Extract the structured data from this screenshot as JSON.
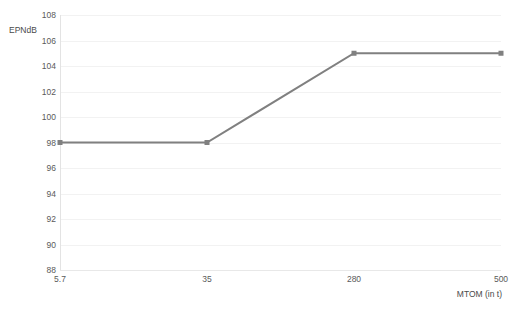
{
  "chart_data": {
    "type": "line",
    "title": "",
    "xlabel": "MTOM (in t)",
    "ylabel": "EPNdB",
    "categories": [
      "5.7",
      "35",
      "280",
      "500"
    ],
    "values": [
      98,
      98,
      105,
      105
    ],
    "series": [
      {
        "name": "EPNdB",
        "values": [
          98,
          98,
          105,
          105
        ]
      }
    ],
    "ylim": [
      88,
      108
    ],
    "yticks": [
      88,
      90,
      92,
      94,
      96,
      98,
      100,
      102,
      104,
      106,
      108
    ],
    "ytick_labels": [
      "88",
      "90",
      "92",
      "94",
      "96",
      "98",
      "100",
      "102",
      "104",
      "106",
      "108"
    ],
    "xtick_labels": [
      "5.7",
      "35",
      "280",
      "500"
    ],
    "grid": true,
    "legend": "none",
    "line_color": "#808080",
    "marker_color": "#808080",
    "marker": "square",
    "grid_color": "#f2f2f2",
    "background_color": "#ffffff",
    "tick_text_color": "#5a5a5a"
  }
}
